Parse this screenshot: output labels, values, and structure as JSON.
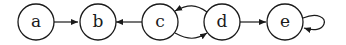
{
  "diagram": {
    "type": "directed-graph",
    "nodes": [
      {
        "id": "a",
        "label": "a"
      },
      {
        "id": "b",
        "label": "b"
      },
      {
        "id": "c",
        "label": "c"
      },
      {
        "id": "d",
        "label": "d"
      },
      {
        "id": "e",
        "label": "e"
      }
    ],
    "edges": [
      {
        "from": "a",
        "to": "b"
      },
      {
        "from": "c",
        "to": "b"
      },
      {
        "from": "d",
        "to": "c"
      },
      {
        "from": "c",
        "to": "d"
      },
      {
        "from": "d",
        "to": "e"
      },
      {
        "from": "e",
        "to": "e"
      }
    ]
  }
}
